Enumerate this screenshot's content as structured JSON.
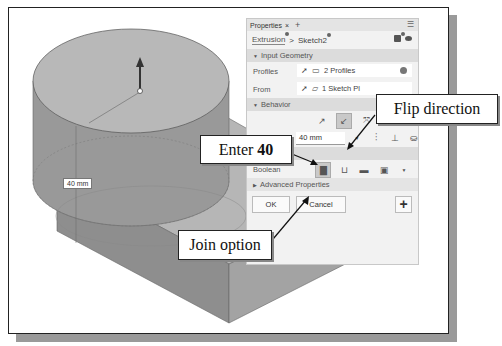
{
  "viewport": {
    "dimension_label": "40 mm"
  },
  "panel": {
    "tab_label": "Properties",
    "tab_close": "×",
    "tab_add": "+",
    "breadcrumb": {
      "first": "Extrusion",
      "separator": ">",
      "second": "Sketch2"
    },
    "sections": {
      "input_geometry": "Input Geometry",
      "behavior": "Behavior",
      "output": "Output",
      "advanced": "Advanced Properties"
    },
    "profiles": {
      "label": "Profiles",
      "value": "2 Profiles"
    },
    "from": {
      "label": "From",
      "value": "1 Sketch Pl"
    },
    "distance": {
      "label": "A",
      "value": "40 mm"
    },
    "boolean": {
      "label": "Boolean"
    },
    "buttons": {
      "ok": "OK",
      "cancel": "Cancel",
      "add": "+"
    },
    "icons": {
      "section_expanded": "▼",
      "section_collapsed": "▶"
    }
  },
  "callouts": {
    "flip": "Flip direction",
    "enter_prefix": "Enter",
    "enter_value": "40",
    "join": "Join option"
  }
}
